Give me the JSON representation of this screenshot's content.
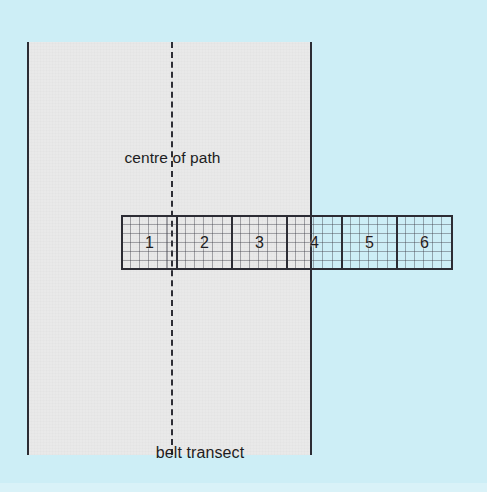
{
  "figure": {
    "background_color": "#cdeef6",
    "path": {
      "fill_color": "#e9e9e9",
      "edge_color": "#2c2c34",
      "centre_line_label": "centre of path",
      "centre_line_style": "dashed"
    },
    "transect": {
      "caption": "belt transect",
      "border_color": "#2c2c34",
      "quadrat_count": 6,
      "quadrats": [
        {
          "label": "1",
          "inside_path": true
        },
        {
          "label": "2",
          "inside_path": true
        },
        {
          "label": "3",
          "inside_path": true
        },
        {
          "label": "4",
          "inside_path": false
        },
        {
          "label": "5",
          "inside_path": false
        },
        {
          "label": "6",
          "inside_path": false
        }
      ]
    }
  }
}
